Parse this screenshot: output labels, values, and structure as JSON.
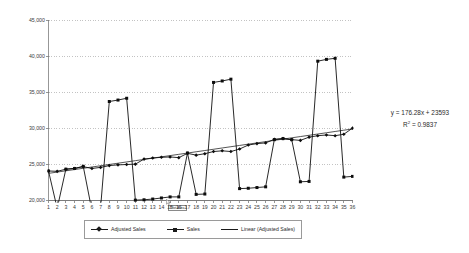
{
  "annotation": {
    "equation": "y = 176.28x + 23593",
    "r_squared_prefix": "R",
    "r_squared_exp": "2",
    "r_squared_value": " = 0.9837"
  },
  "tooltip": {
    "label": "Plot Area"
  },
  "legend": {
    "items": [
      {
        "label": "Adjusted Sales",
        "marker": "diamond-marker-icon"
      },
      {
        "label": "Sales",
        "marker": "square-marker-icon"
      },
      {
        "label": "Linear (Adjusted Sales)",
        "marker": "line-marker-icon"
      }
    ]
  },
  "chart_data": {
    "type": "line",
    "title": "",
    "xlabel": "",
    "ylabel": "",
    "ylim": [
      20000,
      45000
    ],
    "ytick_values": [
      20000,
      25000,
      30000,
      35000,
      40000,
      45000
    ],
    "ytick_labels": [
      "20,000",
      "25,000",
      "30,000",
      "35,000",
      "40,000",
      "45,000"
    ],
    "xlim": [
      1,
      36
    ],
    "x": [
      1,
      2,
      3,
      4,
      5,
      6,
      7,
      8,
      9,
      10,
      11,
      12,
      13,
      14,
      15,
      16,
      17,
      18,
      19,
      20,
      21,
      22,
      23,
      24,
      25,
      26,
      27,
      28,
      29,
      30,
      31,
      32,
      33,
      34,
      35,
      36
    ],
    "xtick_labels": [
      "1",
      "2",
      "3",
      "4",
      "5",
      "6",
      "7",
      "8",
      "9",
      "10",
      "11",
      "12",
      "13",
      "14",
      "15",
      "16",
      "17",
      "18",
      "19",
      "20",
      "21",
      "22",
      "23",
      "24",
      "25",
      "26",
      "27",
      "28",
      "29",
      "30",
      "31",
      "32",
      "33",
      "34",
      "35",
      "36"
    ],
    "grid": true,
    "grid_axis": "y",
    "grid_style": "dotted",
    "legend_position": "bottom",
    "series": [
      {
        "name": "Adjusted Sales",
        "marker": "diamond",
        "values": [
          24100,
          24050,
          24350,
          24450,
          24700,
          24450,
          24600,
          24850,
          24950,
          25000,
          25050,
          25750,
          25900,
          26000,
          26050,
          25950,
          26550,
          26300,
          26500,
          26800,
          26900,
          26800,
          27150,
          27700,
          27900,
          28000,
          28500,
          28600,
          28450,
          28350,
          28800,
          29000,
          29100,
          29000,
          29200,
          30050
        ]
      },
      {
        "name": "Sales",
        "marker": "square",
        "values": [
          24100,
          18900,
          24350,
          24450,
          24750,
          18600,
          19050,
          33750,
          33950,
          34200,
          20050,
          20100,
          20200,
          20350,
          20500,
          20500,
          26600,
          20850,
          20900,
          36400,
          36600,
          36850,
          21650,
          21700,
          21800,
          21900,
          28450,
          28600,
          28450,
          22600,
          22650,
          39350,
          39600,
          39750,
          23250,
          23350
        ]
      },
      {
        "name": "Linear (Adjusted Sales)",
        "type": "trendline",
        "equation": "y = 176.28x + 23593",
        "r_squared": 0.9837,
        "slope": 176.28,
        "intercept": 23593,
        "values": [
          23769,
          23946,
          24122,
          24298,
          24474,
          24651,
          24827,
          25003,
          25179,
          25356,
          25532,
          25708,
          25884,
          26061,
          26237,
          26413,
          26589,
          26766,
          26942,
          27118,
          27294,
          27471,
          27647,
          27823,
          27999,
          28176,
          28352,
          28528,
          28704,
          28881,
          29057,
          29233,
          29409,
          29586,
          29762,
          29938
        ]
      }
    ]
  }
}
